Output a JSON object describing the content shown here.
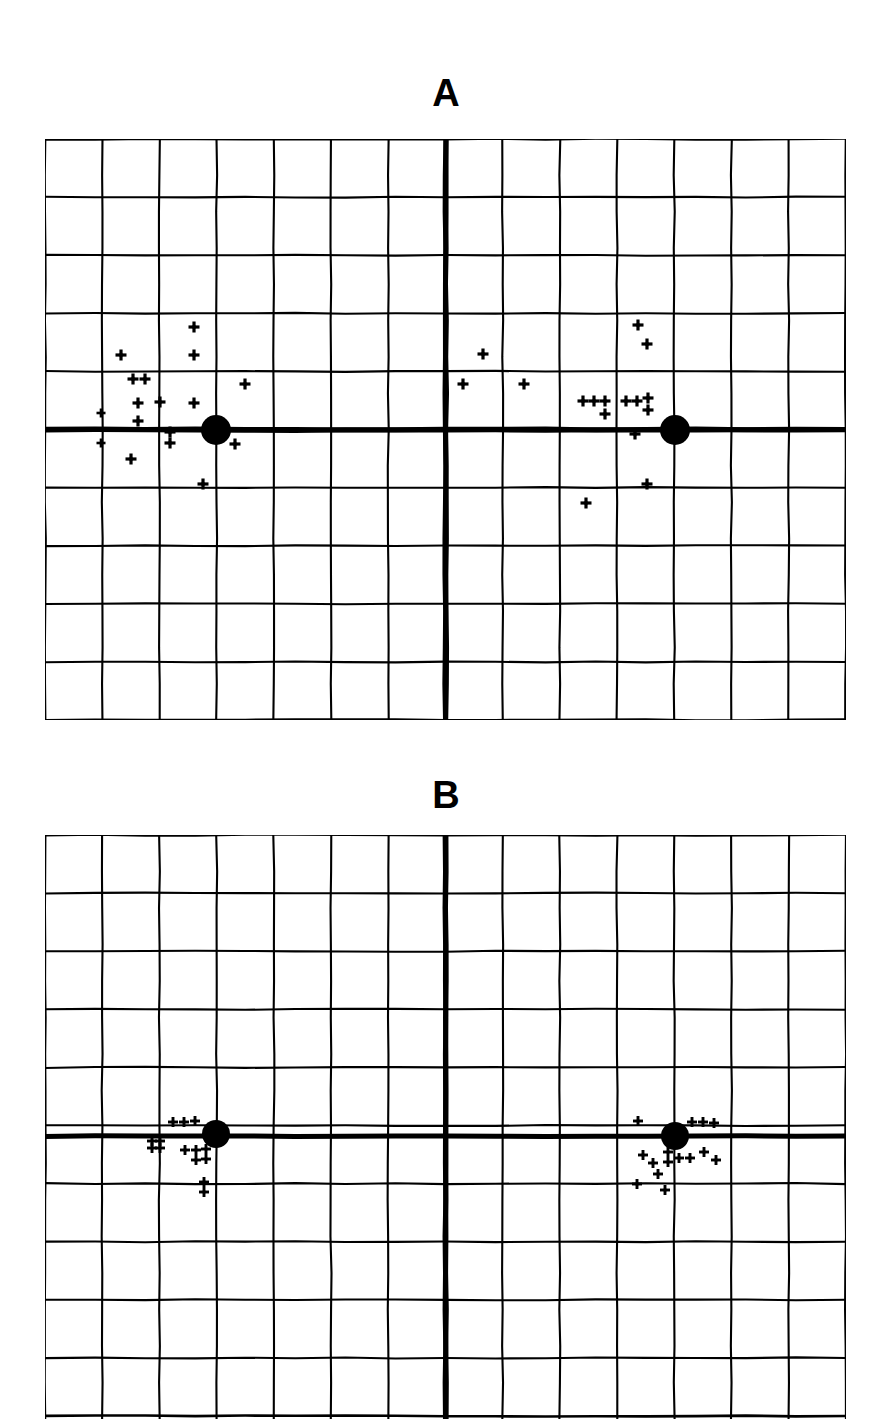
{
  "figure": {
    "background_color": "#ffffff",
    "ink_color": "#000000",
    "panel_count": 2
  },
  "panels": [
    {
      "id": "panel-a",
      "label": "A",
      "label_x": 446,
      "label_y": 78,
      "plot": {
        "x": 45,
        "y": 139,
        "width": 801,
        "height": 581,
        "cols": 14,
        "rows": 10,
        "cell_w": 57.2,
        "cell_h": 58.1,
        "grid_line_width": 2.1,
        "axis_line_width": 5.0,
        "border_line_width": 2.6,
        "axis_x": 446,
        "axis_y": 430
      },
      "reference_dots": [
        {
          "name": "left-fovea-dot",
          "x": 216,
          "y": 430,
          "r": 15
        },
        {
          "name": "right-fovea-dot",
          "x": 675,
          "y": 430,
          "r": 15
        }
      ],
      "markers": [
        {
          "x": 194,
          "y": 327,
          "s": 11
        },
        {
          "x": 121,
          "y": 355,
          "s": 11
        },
        {
          "x": 194,
          "y": 355,
          "s": 11
        },
        {
          "x": 133,
          "y": 379,
          "s": 11
        },
        {
          "x": 145,
          "y": 379,
          "s": 11
        },
        {
          "x": 245,
          "y": 384,
          "s": 11
        },
        {
          "x": 138,
          "y": 403,
          "s": 11
        },
        {
          "x": 160,
          "y": 402,
          "s": 11
        },
        {
          "x": 194,
          "y": 403,
          "s": 11
        },
        {
          "x": 101,
          "y": 413,
          "s": 9
        },
        {
          "x": 138,
          "y": 421,
          "s": 11
        },
        {
          "x": 170,
          "y": 432,
          "s": 11
        },
        {
          "x": 101,
          "y": 443,
          "s": 9
        },
        {
          "x": 170,
          "y": 443,
          "s": 11
        },
        {
          "x": 131,
          "y": 459,
          "s": 11
        },
        {
          "x": 203,
          "y": 484,
          "s": 11
        },
        {
          "x": 235,
          "y": 444,
          "s": 11
        },
        {
          "x": 483,
          "y": 354,
          "s": 11
        },
        {
          "x": 463,
          "y": 384,
          "s": 11
        },
        {
          "x": 524,
          "y": 384,
          "s": 11
        },
        {
          "x": 638,
          "y": 325,
          "s": 11
        },
        {
          "x": 647,
          "y": 344,
          "s": 11
        },
        {
          "x": 583,
          "y": 401,
          "s": 11
        },
        {
          "x": 594,
          "y": 401,
          "s": 11
        },
        {
          "x": 605,
          "y": 401,
          "s": 11
        },
        {
          "x": 605,
          "y": 414,
          "s": 11
        },
        {
          "x": 626,
          "y": 401,
          "s": 11
        },
        {
          "x": 637,
          "y": 401,
          "s": 11
        },
        {
          "x": 648,
          "y": 398,
          "s": 11
        },
        {
          "x": 648,
          "y": 410,
          "s": 11
        },
        {
          "x": 635,
          "y": 434,
          "s": 11
        },
        {
          "x": 647,
          "y": 484,
          "s": 11
        },
        {
          "x": 586,
          "y": 503,
          "s": 11
        }
      ]
    },
    {
      "id": "panel-b",
      "label": "B",
      "label_x": 446,
      "label_y": 780,
      "plot": {
        "x": 45,
        "y": 835,
        "width": 801,
        "height": 584,
        "cols": 14,
        "rows": 10,
        "cell_w": 57.2,
        "cell_h": 58.1,
        "grid_line_width": 2.1,
        "axis_line_width": 5.0,
        "border_line_width": 2.6,
        "axis_x": 446,
        "axis_y": 1136
      },
      "reference_dots": [
        {
          "name": "left-fovea-dot",
          "x": 216,
          "y": 1134,
          "r": 14
        },
        {
          "name": "right-fovea-dot",
          "x": 675,
          "y": 1136,
          "r": 14
        }
      ],
      "markers": [
        {
          "x": 173,
          "y": 1122,
          "s": 10
        },
        {
          "x": 184,
          "y": 1122,
          "s": 10
        },
        {
          "x": 195,
          "y": 1121,
          "s": 10
        },
        {
          "x": 152,
          "y": 1141,
          "s": 10
        },
        {
          "x": 160,
          "y": 1141,
          "s": 10
        },
        {
          "x": 152,
          "y": 1148,
          "s": 10
        },
        {
          "x": 160,
          "y": 1148,
          "s": 10
        },
        {
          "x": 185,
          "y": 1150,
          "s": 10
        },
        {
          "x": 196,
          "y": 1150,
          "s": 10
        },
        {
          "x": 196,
          "y": 1160,
          "s": 10
        },
        {
          "x": 206,
          "y": 1149,
          "s": 10
        },
        {
          "x": 206,
          "y": 1159,
          "s": 10
        },
        {
          "x": 204,
          "y": 1182,
          "s": 10
        },
        {
          "x": 204,
          "y": 1192,
          "s": 10
        },
        {
          "x": 638,
          "y": 1121,
          "s": 10
        },
        {
          "x": 692,
          "y": 1122,
          "s": 10
        },
        {
          "x": 703,
          "y": 1122,
          "s": 10
        },
        {
          "x": 714,
          "y": 1123,
          "s": 10
        },
        {
          "x": 668,
          "y": 1152,
          "s": 10
        },
        {
          "x": 668,
          "y": 1162,
          "s": 10
        },
        {
          "x": 679,
          "y": 1158,
          "s": 10
        },
        {
          "x": 690,
          "y": 1158,
          "s": 10
        },
        {
          "x": 704,
          "y": 1152,
          "s": 10
        },
        {
          "x": 716,
          "y": 1160,
          "s": 10
        },
        {
          "x": 643,
          "y": 1155,
          "s": 10
        },
        {
          "x": 653,
          "y": 1163,
          "s": 10
        },
        {
          "x": 658,
          "y": 1174,
          "s": 10
        },
        {
          "x": 637,
          "y": 1184,
          "s": 10
        },
        {
          "x": 665,
          "y": 1190,
          "s": 10
        }
      ]
    }
  ],
  "chart_data": {
    "type": "scatter",
    "title": "",
    "xlabel": "",
    "ylabel": "",
    "grid": true,
    "legend": "none",
    "axis_units": "grid cell",
    "panels": [
      {
        "name": "A",
        "grid_cols": 14,
        "grid_rows": 10,
        "xlim": [
          -7,
          7
        ],
        "ylim": [
          -5,
          5
        ],
        "reference_points": [
          {
            "label": "left reference",
            "x": -4.0,
            "y": 0.0
          },
          {
            "label": "right reference",
            "x": 4.0,
            "y": 0.0
          }
        ],
        "series": [
          {
            "name": "left cluster plus markers",
            "n": 17,
            "x": [
              -4.4,
              -5.7,
              -4.4,
              -5.5,
              -5.3,
              -3.5,
              -5.4,
              -5.0,
              -4.4,
              -6.0,
              -5.4,
              -4.8,
              -6.0,
              -4.8,
              -5.5,
              -4.3,
              -3.7
            ],
            "y": [
              1.8,
              1.3,
              1.3,
              0.9,
              0.9,
              0.8,
              0.5,
              0.5,
              0.5,
              0.3,
              0.2,
              0.0,
              -0.2,
              -0.2,
              -0.5,
              -0.9,
              -0.2
            ]
          },
          {
            "name": "central and right cluster plus markers",
            "n": 16,
            "x": [
              0.6,
              0.3,
              1.4,
              3.4,
              3.5,
              2.4,
              2.6,
              2.8,
              2.8,
              3.1,
              3.3,
              3.5,
              3.5,
              3.3,
              3.5,
              2.4
            ],
            "y": [
              1.3,
              0.8,
              0.8,
              1.8,
              1.5,
              0.5,
              0.5,
              0.5,
              0.3,
              0.5,
              0.5,
              0.55,
              0.35,
              -0.07,
              -0.9,
              -1.3
            ]
          }
        ]
      },
      {
        "name": "B",
        "grid_cols": 14,
        "grid_rows": 10,
        "xlim": [
          -7,
          7
        ],
        "ylim": [
          -5,
          5
        ],
        "reference_points": [
          {
            "label": "left reference",
            "x": -4.0,
            "y": 0.0
          },
          {
            "label": "right reference",
            "x": 4.0,
            "y": 0.0
          }
        ],
        "series": [
          {
            "name": "left cluster plus markers",
            "n": 14,
            "x": [
              -4.8,
              -4.6,
              -4.4,
              -5.1,
              -5.0,
              -5.1,
              -5.0,
              -4.6,
              -4.4,
              -4.4,
              -4.2,
              -4.2,
              -4.2,
              -4.2
            ],
            "y": [
              0.2,
              0.2,
              0.25,
              -0.1,
              -0.1,
              -0.22,
              -0.22,
              -0.25,
              -0.25,
              -0.43,
              -0.23,
              -0.4,
              -0.8,
              -0.97
            ]
          },
          {
            "name": "right cluster plus markers",
            "n": 15,
            "x": [
              3.35,
              4.3,
              4.5,
              4.7,
              3.9,
              3.9,
              4.1,
              4.3,
              4.5,
              4.7,
              3.45,
              3.6,
              3.7,
              3.35,
              3.8
            ],
            "y": [
              0.25,
              0.24,
              0.24,
              0.22,
              -0.28,
              -0.45,
              -0.38,
              -0.38,
              -0.28,
              -0.41,
              -0.33,
              -0.47,
              -0.66,
              -0.83,
              -0.93
            ]
          }
        ]
      }
    ]
  }
}
